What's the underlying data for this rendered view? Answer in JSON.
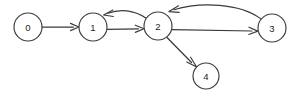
{
  "figure": {
    "type": "directed-graph",
    "width": 301,
    "height": 93,
    "background_color": "#ffffff",
    "stroke_color": "#3a3a3a",
    "node_fill_color": "#ffffff",
    "label_color": "#222222"
  },
  "nodes": [
    {
      "id": "0",
      "label": "0",
      "cx": 28,
      "cy": 27,
      "r": 14
    },
    {
      "id": "1",
      "label": "1",
      "cx": 93,
      "cy": 27,
      "r": 14
    },
    {
      "id": "2",
      "label": "2",
      "cx": 158,
      "cy": 26,
      "r": 14
    },
    {
      "id": "3",
      "label": "3",
      "cx": 272,
      "cy": 28,
      "r": 14
    },
    {
      "id": "4",
      "label": "4",
      "cx": 206,
      "cy": 76,
      "r": 13
    }
  ],
  "edges": [
    {
      "id": "e0-1",
      "from": "0",
      "to": "1",
      "shape": "straight",
      "directed": true
    },
    {
      "id": "e1-2",
      "from": "1",
      "to": "2",
      "shape": "straight",
      "directed": true
    },
    {
      "id": "e2-1",
      "from": "2",
      "to": "1",
      "shape": "arc-above",
      "directed": true
    },
    {
      "id": "e2-3",
      "from": "2",
      "to": "3",
      "shape": "straight",
      "directed": true
    },
    {
      "id": "e3-2",
      "from": "3",
      "to": "2",
      "shape": "arc-above",
      "directed": true
    },
    {
      "id": "e2-4",
      "from": "2",
      "to": "4",
      "shape": "straight",
      "directed": true
    }
  ]
}
